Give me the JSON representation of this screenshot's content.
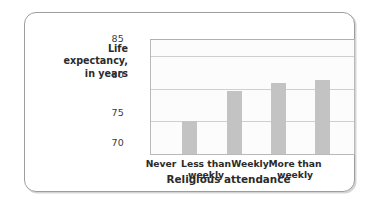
{
  "chart_data": {
    "type": "bar",
    "title": "",
    "subtitle": "",
    "categories": [
      "Never",
      "Less than weekly",
      "Weekly",
      "More than weekly"
    ],
    "values": [
      75.1,
      79.7,
      80.9,
      81.3
    ],
    "xlabel": "Religious attendance",
    "ylabel": "Life expectancy, in years",
    "ylim": [
      70,
      87.5
    ],
    "yticks": [
      70,
      75,
      80,
      85
    ],
    "ytick_labels": [
      "70",
      "75",
      "80",
      "85"
    ],
    "grid": true,
    "legend": null,
    "bar_color": "#c3c3c3",
    "panel_background": "#fcfcfc",
    "border_color": "#9d9d9d",
    "text_color": "#2b2b2b"
  },
  "axis": {
    "y_label_line1": "Life",
    "y_label_line2": "expectancy,",
    "y_label_line3": "in years",
    "x_title": "Religious attendance"
  },
  "categories_wrapped": [
    {
      "line1": "Never",
      "line2": ""
    },
    {
      "line1": "Less than",
      "line2": "weekly"
    },
    {
      "line1": "Weekly",
      "line2": ""
    },
    {
      "line1": "More than",
      "line2": "weekly"
    }
  ],
  "yticks": [
    {
      "label": "85"
    },
    {
      "label": "80"
    },
    {
      "label": "75"
    },
    {
      "label": "70"
    }
  ]
}
